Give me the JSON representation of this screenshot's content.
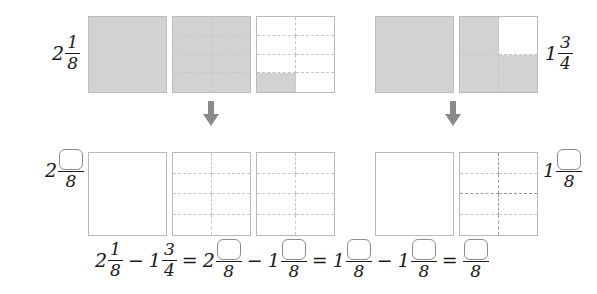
{
  "worksheet": {
    "topic": "mixed-number-subtraction-with-area-models",
    "row1": {
      "left_label": {
        "whole": "2",
        "numerator": "1",
        "denominator": "8"
      },
      "right_label": {
        "whole": "1",
        "numerator": "3",
        "denominator": "4"
      },
      "left_models": [
        {
          "name": "whole-square-full",
          "cols": 1,
          "rows": 1,
          "filled": 1,
          "shade": "all"
        },
        {
          "name": "whole-square-eighths-full",
          "cols": 2,
          "rows": 4,
          "filled": 8,
          "shade": "all"
        },
        {
          "name": "part-square-eighths-one-shaded",
          "cols": 2,
          "rows": 4,
          "filled": 1,
          "shade": "cells"
        }
      ],
      "right_models": [
        {
          "name": "whole-square-full",
          "cols": 1,
          "rows": 1,
          "filled": 1,
          "shade": "all"
        },
        {
          "name": "part-square-fourths-three-shaded",
          "cols": 2,
          "rows": 2,
          "filled": 3,
          "shade": "cells"
        }
      ]
    },
    "row2": {
      "left_label": {
        "whole": "2",
        "numerator": "",
        "denominator": "8"
      },
      "right_label": {
        "whole": "1",
        "numerator": "",
        "denominator": "8"
      },
      "left_models": [
        {
          "name": "whole-square-blank",
          "cols": 1,
          "rows": 1,
          "filled": 0
        },
        {
          "name": "whole-square-eighths-blank",
          "cols": 2,
          "rows": 4,
          "filled": 0
        },
        {
          "name": "part-square-eighths-blank",
          "cols": 2,
          "rows": 4,
          "filled": 0
        }
      ],
      "right_models": [
        {
          "name": "whole-square-blank",
          "cols": 1,
          "rows": 1,
          "filled": 0
        },
        {
          "name": "part-square-eighths-blank-with-fourths",
          "cols": 2,
          "rows": 4,
          "filled": 0
        }
      ]
    },
    "arrows": [
      {
        "name": "convert-arrow-left",
        "direction": "down"
      },
      {
        "name": "convert-arrow-right",
        "direction": "down"
      }
    ],
    "equation": {
      "terms": [
        {
          "type": "mixed",
          "whole": "2",
          "numerator": "1",
          "denominator": "8",
          "boxed": false
        },
        {
          "type": "operator",
          "symbol": "−"
        },
        {
          "type": "mixed",
          "whole": "1",
          "numerator": "3",
          "denominator": "4",
          "boxed": false
        },
        {
          "type": "operator",
          "symbol": "="
        },
        {
          "type": "mixed",
          "whole": "2",
          "numerator": "",
          "denominator": "8",
          "boxed": true
        },
        {
          "type": "operator",
          "symbol": "−"
        },
        {
          "type": "mixed",
          "whole": "1",
          "numerator": "",
          "denominator": "8",
          "boxed": true
        },
        {
          "type": "operator",
          "symbol": "="
        },
        {
          "type": "mixed",
          "whole": "1",
          "numerator": "",
          "denominator": "8",
          "boxed": true
        },
        {
          "type": "operator",
          "symbol": "−"
        },
        {
          "type": "mixed",
          "whole": "1",
          "numerator": "",
          "denominator": "8",
          "boxed": true
        },
        {
          "type": "operator",
          "symbol": "="
        },
        {
          "type": "mixed",
          "whole": "",
          "numerator": "",
          "denominator": "8",
          "boxed": true
        }
      ],
      "plain_text": "2 1/8 − 1 3/4 = 2 □/8 − 1 □/8 = 1 □/8 − 1 □/8 = □/8"
    },
    "colors": {
      "shade": "#d2d2d2",
      "outline": "#b9b9b9",
      "grid": "#c6c6c6",
      "grid_strong": "#9a9a9a",
      "arrow": "#8a8a8a",
      "text": "#1a1a1a",
      "box_outline": "#8c8c8c"
    }
  }
}
